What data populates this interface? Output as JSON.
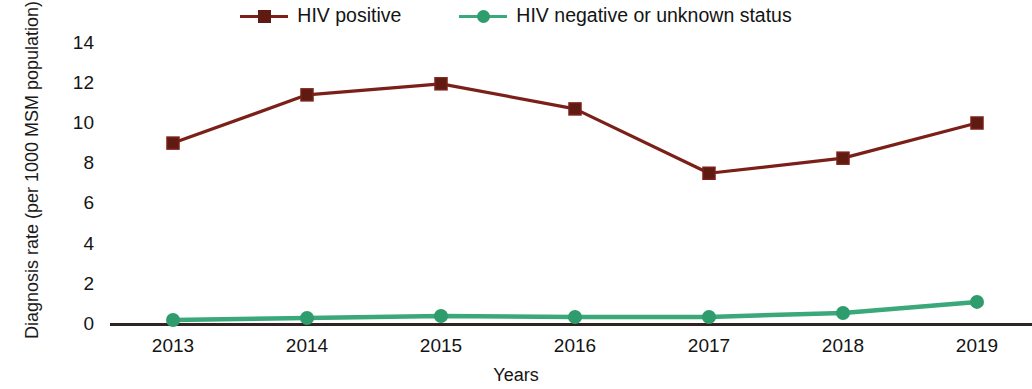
{
  "chart_data": {
    "type": "line",
    "title": "",
    "xlabel": "Years",
    "ylabel": "Diagnosis rate (per 1000 MSM population)",
    "categories": [
      "2013",
      "2014",
      "2015",
      "2016",
      "2017",
      "2018",
      "2019"
    ],
    "x_tick_labels": [
      "2013",
      "2014",
      "2015",
      "2016",
      "2017",
      "2018",
      "2019"
    ],
    "y_tick_labels": [
      "0",
      "2",
      "4",
      "6",
      "8",
      "10",
      "12",
      "14"
    ],
    "y_ticks": [
      0,
      2,
      4,
      6,
      8,
      10,
      12,
      14
    ],
    "ylim": [
      0,
      14.6
    ],
    "grid": false,
    "legend_position": "top-center",
    "series": [
      {
        "name": "HIV positive",
        "color": "#7b2018",
        "marker": "square",
        "values": [
          9.0,
          11.4,
          11.95,
          10.7,
          7.5,
          8.25,
          10.0
        ]
      },
      {
        "name": "HIV negative or unknown status",
        "color": "#3aa87a",
        "marker": "circle",
        "values": [
          0.2,
          0.3,
          0.4,
          0.35,
          0.35,
          0.55,
          1.1
        ]
      }
    ]
  },
  "legend": {
    "entries": [
      {
        "label": "HIV positive",
        "color": "#7b2018",
        "marker": "square-marker-icon"
      },
      {
        "label": "HIV negative or unknown status",
        "color": "#3aa87a",
        "marker": "circle-marker-icon"
      }
    ]
  },
  "axes": {
    "y_title": "Diagnosis rate (per 1000 MSM population)",
    "x_title": "Years",
    "axis_color": "#2e2420"
  }
}
